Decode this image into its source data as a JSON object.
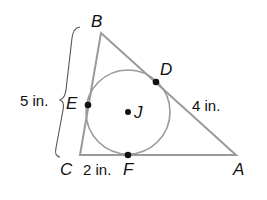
{
  "figure": {
    "vertices": {
      "A": "A",
      "B": "B",
      "C": "C"
    },
    "tangent_points": {
      "D": "D",
      "E": "E",
      "F": "F"
    },
    "center": "J",
    "measurements": {
      "BC": "5 in.",
      "DA": "4 in.",
      "CF": "2 in."
    }
  }
}
